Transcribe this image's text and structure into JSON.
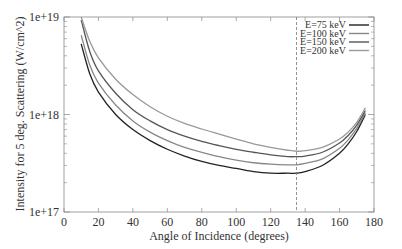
{
  "chart_data": {
    "type": "line",
    "title": "",
    "xlabel": "Angle of Incidence (degrees)",
    "ylabel": "Intensity for 5 deg. Scattering (W/cm^2)",
    "xlim": [
      0,
      180
    ],
    "ylim": [
      1e+17,
      1e+19
    ],
    "yscale": "log",
    "xticks": [
      0,
      20,
      40,
      60,
      80,
      100,
      120,
      140,
      160,
      180
    ],
    "yticks": [
      1e+17,
      1e+18,
      1e+19
    ],
    "ytick_labels": [
      "1e+17",
      "1e+18",
      "1e+19"
    ],
    "grid": false,
    "legend_position": "upper right",
    "annotations": [
      {
        "type": "vertical-dashed-line",
        "x": 135
      }
    ],
    "x": [
      10,
      15,
      20,
      30,
      40,
      50,
      60,
      70,
      80,
      90,
      100,
      110,
      120,
      130,
      135,
      140,
      150,
      160,
      165,
      170,
      175
    ],
    "series": [
      {
        "name": "E=75 keV",
        "color": "#222222",
        "values": [
          5.3e+18,
          2.6e+18,
          1.7e+18,
          1e+18,
          7e+17,
          5.4e+17,
          4.4e+17,
          3.75e+17,
          3.3e+17,
          3e+17,
          2.8e+17,
          2.6e+17,
          2.5e+17,
          2.5e+17,
          2.5e+17,
          2.6e+17,
          3e+17,
          4e+17,
          5e+17,
          6.7e+17,
          1e+18
        ]
      },
      {
        "name": "E=100 keV",
        "color": "#888888",
        "values": [
          6.5e+18,
          3.2e+18,
          2.1e+18,
          1.25e+18,
          8.6e+17,
          6.6e+17,
          5.4e+17,
          4.6e+17,
          4.1e+17,
          3.7e+17,
          3.4e+17,
          3.2e+17,
          3.1e+17,
          3.05e+17,
          3.05e+17,
          3.15e+17,
          3.5e+17,
          4.5e+17,
          5.5e+17,
          7.2e+17,
          1.05e+18
        ]
      },
      {
        "name": "E=150 keV",
        "color": "#555555",
        "values": [
          9.3e+18,
          4.4e+18,
          2.8e+18,
          1.65e+18,
          1.12e+18,
          8.6e+17,
          7e+17,
          6e+17,
          5.3e+17,
          4.8e+17,
          4.4e+17,
          4.1e+17,
          3.85e+17,
          3.7e+17,
          3.7e+17,
          3.75e+17,
          4.1e+17,
          5.1e+17,
          6.1e+17,
          7.8e+17,
          1.1e+18
        ]
      },
      {
        "name": "E=200 keV",
        "color": "#999999",
        "values": [
          1e+19,
          5.6e+18,
          3.8e+18,
          2.3e+18,
          1.6e+18,
          1.2e+18,
          9.6e+17,
          8.1e+17,
          7.1e+17,
          6.3e+17,
          5.6e+17,
          5e+17,
          4.6e+17,
          4.3e+17,
          4.2e+17,
          4.25e+17,
          4.6e+17,
          5.6e+17,
          6.6e+17,
          8.3e+17,
          1.17e+18
        ]
      }
    ]
  }
}
